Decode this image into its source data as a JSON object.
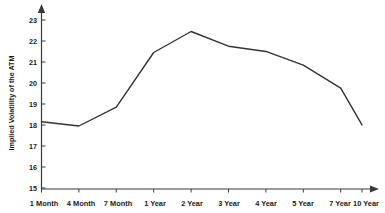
{
  "chart_data": {
    "type": "line",
    "title": "",
    "xlabel": "",
    "ylabel": "Implied Volatility of the ATM",
    "categories": [
      "1 Month",
      "4 Month",
      "7 Month",
      "1 Year",
      "2 Year",
      "3 Year",
      "4 Year",
      "5 Year",
      "7 Year",
      "10 Year"
    ],
    "values": [
      18.2,
      18.0,
      18.9,
      21.5,
      22.5,
      21.8,
      21.55,
      20.9,
      19.8,
      18.05
    ],
    "series": [
      {
        "name": "Implied Volatility of the ATM",
        "values": [
          18.2,
          18.0,
          18.9,
          21.5,
          22.5,
          21.8,
          21.55,
          20.9,
          19.8,
          18.05
        ]
      }
    ],
    "ylim": [
      15,
      23
    ],
    "ytick_labels": [
      "15",
      "16",
      "17",
      "18",
      "19",
      "20",
      "21",
      "22",
      "23"
    ],
    "ytick_values": [
      15,
      16,
      17,
      18,
      19,
      20,
      21,
      22,
      23
    ],
    "grid": false,
    "legend": "none",
    "line_color": "#333333",
    "axis_color": "#3a3a3a",
    "background_color": "#ffffff"
  },
  "axes": {
    "y_axis_title": "Implied Volatility of the ATM",
    "x_axis_title": ""
  }
}
